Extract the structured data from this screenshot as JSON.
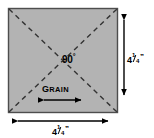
{
  "diagram": {
    "shape": {
      "name": "square-patch",
      "fill_color": "#b3b3b3",
      "border_color": "#4d4d4d",
      "x": 8,
      "y": 8,
      "width": 110,
      "height": 105
    },
    "diagonals": {
      "name": "dashed-diagonals",
      "style": "dashed",
      "color": "#3a3a3a",
      "count": 2
    },
    "labels": {
      "angle": "90",
      "angle_symbol": "°",
      "grain": "GRAIN",
      "grain_first_letter": "G",
      "grain_rest": "RAIN"
    },
    "dimensions": {
      "right": {
        "whole": "4",
        "numerator": "1",
        "denominator": "4",
        "unit": "”",
        "full_text": "4 1/4”"
      },
      "bottom": {
        "whole": "4",
        "numerator": "1",
        "denominator": "4",
        "unit": "”",
        "full_text": "4 1/4”"
      }
    },
    "arrows": {
      "grain_arrow": "double-headed-horizontal-arrow",
      "height_arrow": "double-headed-vertical-arrow",
      "width_arrow": "double-headed-horizontal-arrow"
    },
    "colors": {
      "background": "#ffffff",
      "fill": "#b3b3b3",
      "stroke": "#000000",
      "border": "#4d4d4d"
    }
  }
}
